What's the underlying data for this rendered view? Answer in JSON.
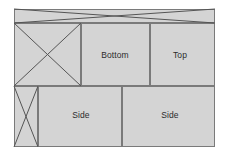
{
  "diagram": {
    "type": "carton-unfolding-template",
    "colors": {
      "background": "#ffffff",
      "panel_fill": "#d4d4d4",
      "panel_stroke": "#7a7a7a",
      "cross_stroke": "#555555",
      "label_color": "#2b2b2b"
    },
    "canvas": {
      "width": 229,
      "height": 157
    },
    "sheet": {
      "x": 14,
      "y": 9,
      "width": 201,
      "height": 138
    },
    "rows": {
      "flap_strip": {
        "y": 9,
        "height": 14
      },
      "upper": {
        "y": 23,
        "height": 63
      },
      "lower": {
        "y": 86,
        "height": 61
      }
    },
    "panels": [
      {
        "id": "flap-strip",
        "label": "",
        "x": 14,
        "y": 9,
        "width": 201,
        "height": 14,
        "crossed": true,
        "label_x": 0,
        "label_y": 0
      },
      {
        "id": "upper-crossed-panel",
        "label": "",
        "x": 14,
        "y": 23,
        "width": 67,
        "height": 63,
        "crossed": true,
        "label_x": 0,
        "label_y": 0
      },
      {
        "id": "bottom-panel",
        "label": "Bottom",
        "x": 81,
        "y": 23,
        "width": 69,
        "height": 63,
        "crossed": false,
        "label_x": 115,
        "label_y": 55
      },
      {
        "id": "top-panel",
        "label": "Top",
        "x": 150,
        "y": 23,
        "width": 65,
        "height": 63,
        "crossed": false,
        "label_x": 180,
        "label_y": 55
      },
      {
        "id": "lower-crossed-panel",
        "label": "",
        "x": 14,
        "y": 86,
        "width": 24,
        "height": 61,
        "crossed": true,
        "label_x": 0,
        "label_y": 0
      },
      {
        "id": "side-panel-left",
        "label": "Side",
        "x": 38,
        "y": 86,
        "width": 84,
        "height": 61,
        "crossed": false,
        "label_x": 81,
        "label_y": 115
      },
      {
        "id": "side-panel-right",
        "label": "Side",
        "x": 122,
        "y": 86,
        "width": 93,
        "height": 61,
        "crossed": false,
        "label_x": 170,
        "label_y": 115
      }
    ]
  }
}
